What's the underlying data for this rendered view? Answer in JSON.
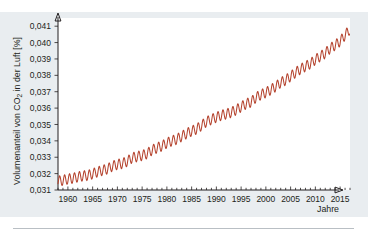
{
  "figure": {
    "panel_bg": "#e9edf0",
    "plot_bg": "#ffffff",
    "axis_color": "#231f20",
    "rule_color": "#b9bfc4"
  },
  "chart_data": {
    "type": "line",
    "title": "",
    "subtitle": "",
    "xlabel": "Jahre",
    "ylabel": "Volumenanteil von CO2 in der Luft [%]",
    "ylabel_parts": {
      "before": "Volumenanteil von CO",
      "subscript": "2",
      "after": " in der Luft [%]"
    },
    "grid": false,
    "legend": "none",
    "xlim": [
      1958,
      2017
    ],
    "ylim": [
      0.031,
      0.0415
    ],
    "xticks": [
      1960,
      1965,
      1970,
      1975,
      1980,
      1985,
      1990,
      1995,
      2000,
      2005,
      2010,
      2015
    ],
    "xtick_labels": [
      "1960",
      "1965",
      "1970",
      "1975",
      "1980",
      "1985",
      "1990",
      "1995",
      "2000",
      "2005",
      "2010",
      "2015"
    ],
    "xtick_minor_step": 1,
    "yticks": [
      0.031,
      0.032,
      0.033,
      0.034,
      0.035,
      0.036,
      0.037,
      0.038,
      0.039,
      0.04,
      0.041
    ],
    "ytick_labels": [
      "0,031",
      "0,032",
      "0,033",
      "0,034",
      "0,035",
      "0,036",
      "0,037",
      "0,038",
      "0,039",
      "0,040",
      "0,041"
    ],
    "decimal_separator": ",",
    "series": [
      {
        "name": "CO2-Volumenanteil (Keeling-Kurve)",
        "color": "#b5442f",
        "seasonal_amplitude": 0.00031,
        "seasonal_peak_month": 5,
        "x": [
          1958,
          1959,
          1960,
          1961,
          1962,
          1963,
          1964,
          1965,
          1966,
          1967,
          1968,
          1969,
          1970,
          1971,
          1972,
          1973,
          1974,
          1975,
          1976,
          1977,
          1978,
          1979,
          1980,
          1981,
          1982,
          1983,
          1984,
          1985,
          1986,
          1987,
          1988,
          1989,
          1990,
          1991,
          1992,
          1993,
          1994,
          1995,
          1996,
          1997,
          1998,
          1999,
          2000,
          2001,
          2002,
          2003,
          2004,
          2005,
          2006,
          2007,
          2008,
          2009,
          2010,
          2011,
          2012,
          2013,
          2014,
          2015,
          2016
        ],
        "values": [
          0.03154,
          0.03159,
          0.03167,
          0.03172,
          0.0318,
          0.03186,
          0.03189,
          0.03199,
          0.03211,
          0.0322,
          0.03229,
          0.03246,
          0.03256,
          0.03262,
          0.03275,
          0.03297,
          0.03304,
          0.03311,
          0.03322,
          0.03344,
          0.03357,
          0.03369,
          0.03387,
          0.034,
          0.0341,
          0.03428,
          0.03445,
          0.0346,
          0.03472,
          0.03494,
          0.03517,
          0.03531,
          0.03544,
          0.03556,
          0.03564,
          0.03574,
          0.03589,
          0.03608,
          0.03626,
          0.03637,
          0.03665,
          0.03682,
          0.03695,
          0.03712,
          0.03732,
          0.03756,
          0.03771,
          0.03794,
          0.03817,
          0.03838,
          0.03855,
          0.03871,
          0.03896,
          0.03916,
          0.03935,
          0.03965,
          0.03984,
          0.04008,
          0.04045
        ]
      }
    ]
  }
}
